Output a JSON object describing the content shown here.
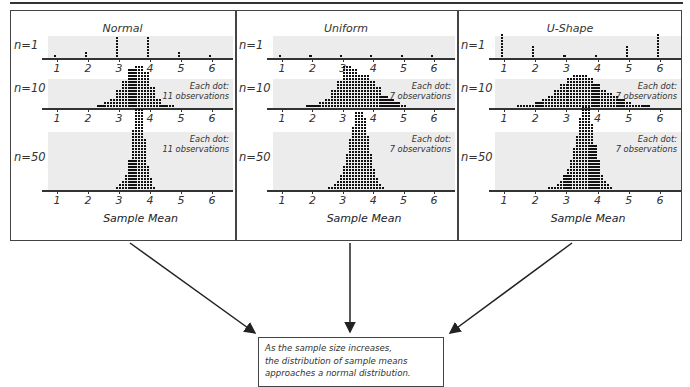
{
  "figure": {
    "x_axis_label": "Sample Mean",
    "tick_labels": [
      "1",
      "2",
      "3",
      "4",
      "5",
      "6"
    ],
    "row_labels": [
      "n=1",
      "n=10",
      "n=50"
    ],
    "conclusion": [
      "As the sample size increases,",
      "the distribution of sample means",
      "approaches a normal distribution."
    ],
    "panels": [
      {
        "title": "Normal",
        "note_line1": "Each dot:",
        "note_line2": "11 observations"
      },
      {
        "title": "Uniform",
        "note_line1": "Each dot:",
        "note_line2": "7 observations"
      },
      {
        "title": "U-Shape",
        "note_line1": "Each dot:",
        "note_line2": "7 observations"
      }
    ]
  },
  "chart_data": [
    {
      "type": "scatter",
      "subtype": "dot plot",
      "title": "Normal — n=1",
      "x": [
        1,
        2,
        3,
        4,
        5,
        6
      ],
      "values": [
        1,
        2,
        7,
        7,
        2,
        1
      ],
      "xlim": [
        0.5,
        6.8
      ]
    },
    {
      "type": "scatter",
      "subtype": "dot plot",
      "title": "Normal — n=10",
      "note": "Each dot: 11 observations",
      "x": [
        2.4,
        2.6,
        2.8,
        3.0,
        3.2,
        3.4,
        3.6,
        3.8,
        4.0,
        4.2,
        4.4,
        4.6
      ],
      "values": [
        1,
        2,
        3,
        6,
        9,
        13,
        14,
        12,
        7,
        3,
        1,
        1
      ],
      "xlabel": "",
      "xlim": [
        0.5,
        6.8
      ]
    },
    {
      "type": "scatter",
      "subtype": "dot plot",
      "title": "Normal — n=50",
      "note": "Each dot: 11 observations",
      "x": [
        3.0,
        3.1,
        3.2,
        3.3,
        3.4,
        3.5,
        3.6,
        3.7,
        3.8,
        3.9,
        4.0
      ],
      "values": [
        1,
        2,
        3,
        5,
        10,
        20,
        27,
        17,
        8,
        4,
        1
      ],
      "xlabel": "Sample Mean",
      "xlim": [
        0.5,
        6.8
      ]
    },
    {
      "type": "scatter",
      "subtype": "dot plot",
      "title": "Uniform — n=1",
      "x": [
        1,
        2,
        3,
        4,
        5,
        6
      ],
      "values": [
        1,
        1,
        1,
        1,
        1,
        1
      ],
      "xlim": [
        0.5,
        6.8
      ]
    },
    {
      "type": "scatter",
      "subtype": "dot plot",
      "title": "Uniform — n=10",
      "note": "Each dot: 7 observations",
      "x": [
        1.9,
        2.1,
        2.3,
        2.5,
        2.7,
        2.9,
        3.1,
        3.3,
        3.5,
        3.7,
        3.9,
        4.1,
        4.3,
        4.5,
        4.7,
        4.9
      ],
      "values": [
        1,
        1,
        2,
        3,
        6,
        9,
        14,
        13,
        11,
        11,
        9,
        7,
        4,
        3,
        2,
        1
      ],
      "xlim": [
        0.5,
        6.8
      ]
    },
    {
      "type": "scatter",
      "subtype": "dot plot",
      "title": "Uniform — n=50",
      "note": "Each dot: 7 observations",
      "x": [
        2.6,
        2.7,
        2.8,
        2.9,
        3.0,
        3.1,
        3.2,
        3.3,
        3.4,
        3.5,
        3.6,
        3.7,
        3.8,
        3.9,
        4.0,
        4.1,
        4.2
      ],
      "values": [
        1,
        1,
        2,
        3,
        5,
        8,
        12,
        17,
        21,
        26,
        24,
        18,
        12,
        7,
        4,
        2,
        1
      ],
      "xlabel": "Sample Mean",
      "xlim": [
        0.5,
        6.8
      ]
    },
    {
      "type": "scatter",
      "subtype": "dot plot",
      "title": "U-Shape — n=1",
      "x": [
        1,
        2,
        3,
        4,
        5,
        6
      ],
      "values": [
        8,
        4,
        1,
        1,
        4,
        8
      ],
      "xlim": [
        0.5,
        6.8
      ]
    },
    {
      "type": "scatter",
      "subtype": "dot plot",
      "title": "U-Shape — n=10",
      "note": "Each dot: 7 observations",
      "x": [
        1.5,
        1.7,
        1.9,
        2.1,
        2.3,
        2.5,
        2.7,
        2.9,
        3.1,
        3.3,
        3.5,
        3.7,
        3.9,
        4.1,
        4.3,
        4.5,
        4.7,
        4.9,
        5.1,
        5.3,
        5.5
      ],
      "values": [
        1,
        1,
        1,
        2,
        3,
        4,
        6,
        8,
        10,
        11,
        11,
        10,
        8,
        6,
        5,
        4,
        3,
        2,
        1,
        1,
        1
      ],
      "xlim": [
        0.5,
        6.8
      ]
    },
    {
      "type": "scatter",
      "subtype": "dot plot",
      "title": "U-Shape — n=50",
      "note": "Each dot: 7 observations",
      "x": [
        2.5,
        2.6,
        2.7,
        2.8,
        2.9,
        3.0,
        3.1,
        3.2,
        3.3,
        3.4,
        3.5,
        3.6,
        3.7,
        3.8,
        3.9,
        4.0,
        4.1,
        4.2,
        4.3
      ],
      "values": [
        1,
        1,
        1,
        2,
        3,
        5,
        7,
        10,
        14,
        18,
        24,
        28,
        22,
        15,
        10,
        5,
        3,
        2,
        1
      ],
      "xlabel": "Sample Mean",
      "xlim": [
        0.5,
        6.8
      ]
    }
  ]
}
